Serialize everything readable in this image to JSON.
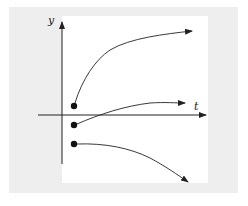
{
  "diagram": {
    "axes": {
      "x_label": "t",
      "y_label": "y"
    },
    "curves": [
      {
        "name": "upper-curve",
        "start": "above t-axis",
        "behavior": "increasing, concave down"
      },
      {
        "name": "middle-curve",
        "start": "just below t-axis",
        "behavior": "increasing, levels off"
      },
      {
        "name": "lower-curve",
        "start": "below t-axis",
        "behavior": "decreasing, concave down"
      }
    ],
    "colors": {
      "background": "#eeeeee",
      "plot_area": "#ffffff",
      "ink": "#222222"
    }
  }
}
